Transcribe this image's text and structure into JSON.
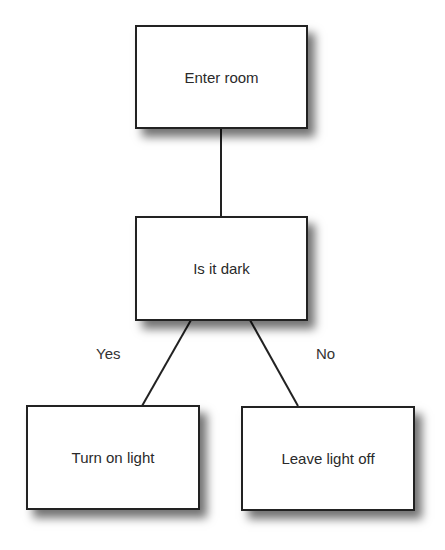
{
  "diagram": {
    "type": "decision-tree",
    "nodes": {
      "start": "Enter room",
      "decision": "Is it dark",
      "yes_outcome": "Turn on light",
      "no_outcome": "Leave light off"
    },
    "edges": {
      "yes_label": "Yes",
      "no_label": "No"
    },
    "colors": {
      "line": "#222222",
      "box_fill": "#ffffff",
      "text": "#2a2a2a"
    }
  }
}
